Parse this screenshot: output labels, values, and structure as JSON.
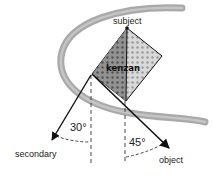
{
  "diagram": {
    "labels": {
      "subject": "subject",
      "kenzan": "kenzan",
      "secondary": "secondary",
      "object": "object"
    },
    "angles": {
      "secondary_angle": "30°",
      "object_angle": "45°"
    },
    "colors": {
      "crescent": "#8e8e8e",
      "kenzan_dark": "#6b6b6b",
      "kenzan_light": "#cfcfcf",
      "lines": "#111111"
    }
  }
}
